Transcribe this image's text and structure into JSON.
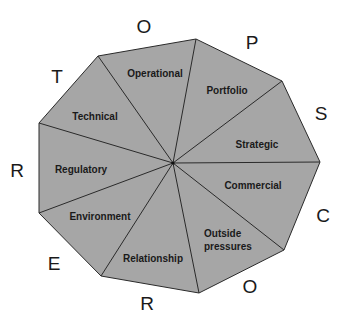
{
  "diagram": {
    "fill_color": "#a6a6a6",
    "stroke_color": "#2a2a2a",
    "segments": [
      {
        "label": "Operational",
        "lines": [
          "Operational"
        ]
      },
      {
        "label": "Portfolio",
        "lines": [
          "Portfolio"
        ]
      },
      {
        "label": "Strategic",
        "lines": [
          "Strategic"
        ]
      },
      {
        "label": "Commercial",
        "lines": [
          "Commercial"
        ]
      },
      {
        "label": "Outside pressures",
        "lines": [
          "Outside",
          "pressures"
        ]
      },
      {
        "label": "Relationship",
        "lines": [
          "Relationship"
        ]
      },
      {
        "label": "Environment",
        "lines": [
          "Environment"
        ]
      },
      {
        "label": "Regulatory",
        "lines": [
          "Regulatory"
        ]
      },
      {
        "label": "Technical",
        "lines": [
          "Technical"
        ]
      }
    ],
    "letters": [
      "O",
      "P",
      "S",
      "C",
      "O",
      "R",
      "E",
      "R",
      "T"
    ]
  }
}
